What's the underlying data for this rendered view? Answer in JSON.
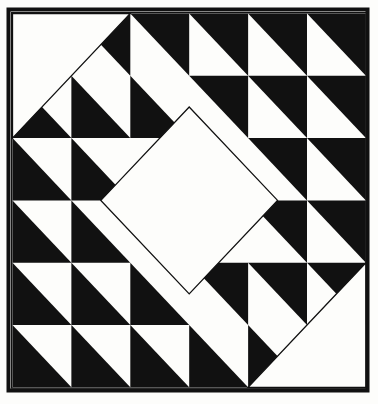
{
  "artwork": {
    "title": "Quilt Block Pattern",
    "kind": "half-square-triangle quilt block",
    "canvas": {
      "width": 378,
      "height": 404
    },
    "colors": {
      "ink": "#111111",
      "paper": "#fdfdfb",
      "frame": "#111111"
    },
    "frame": {
      "x": 8.5,
      "y": 9.5,
      "width": 359,
      "height": 381,
      "stroke_width": 4,
      "inner_stroke_width": 1.4
    },
    "grid": {
      "columns": 6,
      "rows": 6,
      "origin_x": 12.5,
      "origin_y": 13.5,
      "cell_width": 58.9,
      "cell_height": 62.3,
      "hairline_width": 1.3
    },
    "legend": {
      "dark_label": "dark patch",
      "light_label": "light patch",
      "diamond_label": "center on-point square",
      "corner_label": "corner setting triangle"
    }
  },
  "chart_data": {
    "type": "heatmap",
    "title": "Quilt Block Pattern",
    "xlabel": "",
    "ylabel": "",
    "categories": [
      "c0",
      "c1",
      "c2",
      "c3",
      "c4",
      "c5"
    ],
    "rows": [
      "r0",
      "r1",
      "r2",
      "r3",
      "r4",
      "r5"
    ],
    "note": "Each of the 36 cells is a half-square triangle. Code letters give which corner is dark: tl=top-left dark, tr=top-right dark, bl=bottom-left dark, br=bottom-right dark, W=all light, K=all dark.",
    "cells": [
      [
        "W",
        "tr",
        "tr",
        "tr",
        "tr",
        "tr"
      ],
      [
        "bl",
        "bl",
        "bl",
        "tr",
        "tr",
        "tr"
      ],
      [
        "bl",
        "bl",
        "W",
        "W",
        "tr",
        "tr"
      ],
      [
        "bl",
        "bl",
        "W",
        "W",
        "tr",
        "tr"
      ],
      [
        "bl",
        "bl",
        "bl",
        "tr",
        "tr",
        "tr"
      ],
      [
        "bl",
        "bl",
        "bl",
        "bl",
        "bl",
        "W"
      ]
    ],
    "overlays": [
      {
        "name": "top-left-corner-triangle",
        "shape": "triangle",
        "fill": "light",
        "points_cells": [
          [
            0,
            0
          ],
          [
            2,
            0
          ],
          [
            0,
            2
          ]
        ]
      },
      {
        "name": "bottom-right-corner-triangle",
        "shape": "triangle",
        "fill": "light",
        "points_cells": [
          [
            6,
            6
          ],
          [
            4,
            6
          ],
          [
            6,
            4
          ]
        ]
      },
      {
        "name": "center-diamond",
        "shape": "square-on-point",
        "fill": "light",
        "center_cell": [
          3,
          3
        ],
        "half_diagonal_cells": 1.5
      }
    ]
  }
}
